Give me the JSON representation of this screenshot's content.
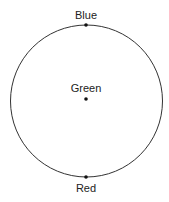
{
  "diagram": {
    "circle": {
      "cx": 86.5,
      "cy": 101,
      "r": 76,
      "stroke": "#333333"
    },
    "points": [
      {
        "label": "Blue",
        "x": 86,
        "y": 25,
        "label_y": 19
      },
      {
        "label": "Green",
        "x": 86,
        "y": 99,
        "label_y": 92
      },
      {
        "label": "Red",
        "x": 86,
        "y": 177,
        "label_y": 192
      }
    ]
  }
}
